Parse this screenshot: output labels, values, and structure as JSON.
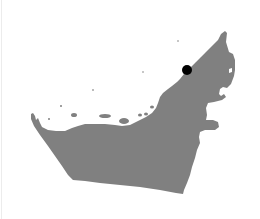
{
  "map": {
    "country": "United Arab Emirates",
    "land_color": "#808080",
    "water_color": "#ffffff",
    "marker": {
      "label": "location-marker",
      "x": 187,
      "y": 70,
      "radius": 5,
      "color": "#000000"
    }
  }
}
